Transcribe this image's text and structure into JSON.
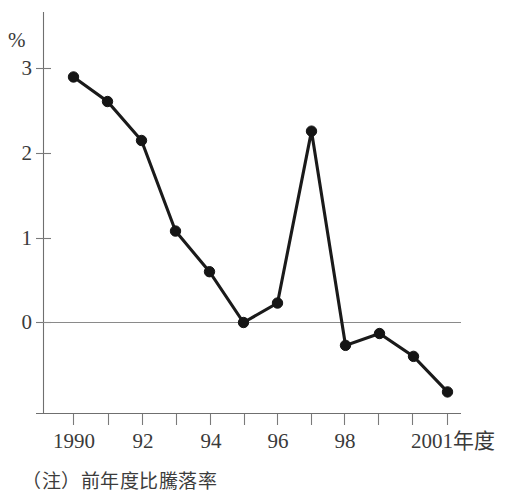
{
  "chart_data": {
    "type": "line",
    "title": "",
    "xlabel": "年度",
    "ylabel": "%",
    "unit_label": "%",
    "x": [
      1990,
      1991,
      1992,
      1993,
      1994,
      1995,
      1996,
      1997,
      1998,
      1999,
      2000,
      2001
    ],
    "values": [
      2.9,
      2.61,
      2.15,
      1.08,
      0.6,
      0.0,
      0.23,
      2.26,
      -0.27,
      -0.13,
      -0.4,
      -0.82
    ],
    "series": [
      {
        "name": "前年度比騰落率",
        "values": [
          2.9,
          2.61,
          2.15,
          1.08,
          0.6,
          0.0,
          0.23,
          2.26,
          -0.27,
          -0.13,
          -0.4,
          -0.82
        ]
      }
    ],
    "y_ticks": [
      0,
      1,
      2,
      3
    ],
    "y_tick_labels": [
      "0",
      "1",
      "2",
      "3"
    ],
    "ylim": [
      -1.0,
      3.3
    ],
    "xlim": [
      1989.6,
      2001.6
    ],
    "x_tick_labels": [
      "1990",
      "",
      "92",
      "",
      "94",
      "",
      "96",
      "",
      "98",
      "",
      "",
      "2001年度"
    ],
    "grid": false,
    "legend": "none",
    "zero_line": true,
    "marker": "filled-circle"
  },
  "axis": {
    "y_unit": "%",
    "y_tick_0": "0",
    "y_tick_1": "1",
    "y_tick_2": "2",
    "y_tick_3": "3",
    "x_tick_1990": "1990",
    "x_tick_92": "92",
    "x_tick_94": "94",
    "x_tick_96": "96",
    "x_tick_98": "98",
    "x_tick_2001": "2001年度"
  },
  "note": {
    "text": "（注）前年度比騰落率"
  }
}
